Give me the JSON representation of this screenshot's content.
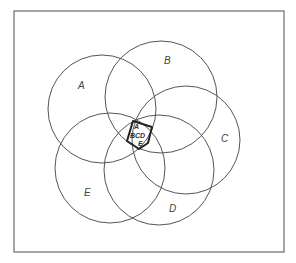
{
  "diagram": {
    "type": "venn",
    "sets": [
      "A",
      "B",
      "C",
      "D",
      "E"
    ],
    "colors": {
      "frame": "#6b6b6b",
      "circle": "#555555",
      "core": "#222222",
      "label": "#444444"
    },
    "frame": {
      "x": 14,
      "y": 11,
      "w": 270,
      "h": 241
    },
    "circles": [
      {
        "label": "A",
        "cx": 102,
        "cy": 109,
        "r": 54,
        "label_x": 78,
        "label_y": 89
      },
      {
        "label": "B",
        "cx": 161,
        "cy": 97,
        "r": 56,
        "label_x": 164,
        "label_y": 64
      },
      {
        "label": "C",
        "cx": 186,
        "cy": 140,
        "r": 54,
        "label_x": 221,
        "label_y": 142
      },
      {
        "label": "D",
        "cx": 159,
        "cy": 170,
        "r": 55,
        "label_x": 169,
        "label_y": 212
      },
      {
        "label": "E",
        "cx": 110,
        "cy": 168,
        "r": 55,
        "label_x": 84,
        "label_y": 196
      }
    ],
    "core": {
      "points": "133,121 152,127 148,143 139,149 127,141",
      "labels": [
        {
          "text": "A",
          "x": 134,
          "y": 129
        },
        {
          "text": "BCD",
          "x": 130,
          "y": 138
        },
        {
          "text": "E",
          "x": 138,
          "y": 146
        }
      ]
    }
  }
}
